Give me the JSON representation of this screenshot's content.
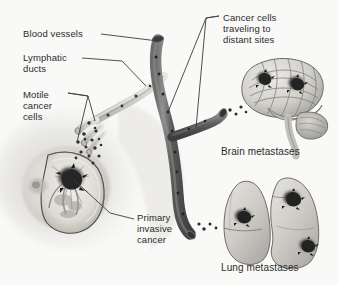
{
  "figure": {
    "background_color": "#f9f9f8",
    "ink_color": "#2b2b2b"
  },
  "labels": {
    "blood_vessels": "Blood vessels",
    "lymphatic_ducts": "Lymphatic\nducts",
    "motile_cancer_cells": "Motile\ncancer\ncells",
    "primary_invasive_cancer": "Primary\ninvasive\ncancer",
    "cancer_cells_traveling": "Cancer cells\ntraveling to\ndistant sites"
  },
  "captions": {
    "brain": "Brain metastases",
    "lung": "Lung metastases"
  },
  "anatomy": {
    "breast_primary_tumor": "primary-invasive-tumor",
    "lymphatic_duct": "lymphatic-duct",
    "blood_vessel": "blood-vessel",
    "brain": "brain-lateral-view",
    "lungs": "lungs-anterior-view"
  },
  "colors": {
    "vessel_dark": "#5b5b5b",
    "vessel_mid": "#7a7a7a",
    "vessel_light": "#a6a6a6",
    "lymph_fill": "#d9d9d6",
    "lymph_stroke": "#8e8e8c",
    "tissue_light": "#e4e3e0",
    "tissue_mid": "#c9c8c4",
    "tumor_dark": "#3a3a3a",
    "cell_dot": "#2e2e2e",
    "leader_line": "#3c3c3c"
  },
  "counts": {
    "brain_metastases": 2,
    "lung_metastases": 3,
    "cells_in_vessel": 9,
    "motile_cells_cluster": 12
  }
}
